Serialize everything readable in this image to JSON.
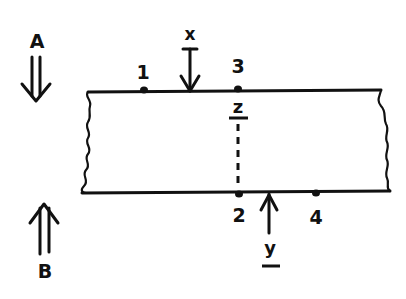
{
  "diagram": {
    "type": "beam-section",
    "labels": {
      "A": "A",
      "B": "B",
      "x": "x",
      "y": "y",
      "z": "z",
      "p1": "1",
      "p2": "2",
      "p3": "3",
      "p4": "4"
    },
    "arrows": {
      "A_direction": "down",
      "B_direction": "up",
      "x_direction": "down",
      "y_direction": "up"
    },
    "colors": {
      "ink": "#111111",
      "background": "#ffffff"
    }
  }
}
